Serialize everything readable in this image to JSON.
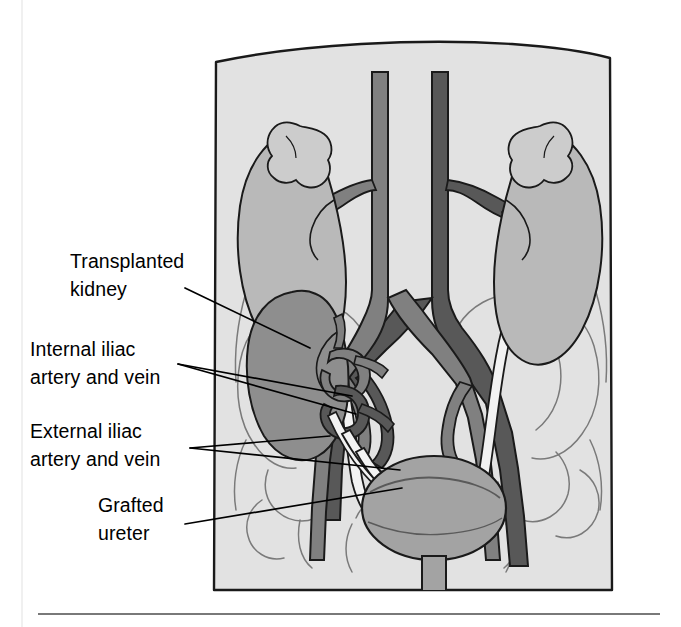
{
  "figure": {
    "title_visible": false,
    "labels": [
      {
        "id": "transplanted-kidney",
        "lines": [
          "Transplanted",
          "kidney"
        ],
        "x": 70,
        "y": 268,
        "align": "start"
      },
      {
        "id": "internal-iliac",
        "lines": [
          "Internal iliac",
          "artery and vein"
        ],
        "x": 30,
        "y": 356,
        "align": "start"
      },
      {
        "id": "external-iliac",
        "lines": [
          "External iliac",
          "artery and vein"
        ],
        "x": 30,
        "y": 438,
        "align": "start"
      },
      {
        "id": "grafted-ureter",
        "lines": [
          "Grafted",
          "ureter"
        ],
        "x": 98,
        "y": 512,
        "align": "start"
      }
    ],
    "colors": {
      "background": "#ffffff",
      "body_fill": "#e2e2e2",
      "body_outline": "#1a1a1a",
      "native_kidney_fill": "#b9b9b9",
      "transplant_kidney_fill": "#8e8e8e",
      "adrenal_fill": "#cccccc",
      "aorta_fill": "#808080",
      "vena_cava_fill": "#585858",
      "bladder_fill": "#a3a3a3",
      "ureter_fill": "#f2f2f2",
      "bone_outline": "#6f6f6f",
      "leader_line": "#000000",
      "rule_line": "#4d4d4d",
      "label_text": "#000000"
    },
    "rule": {
      "x1": 38,
      "x2": 660,
      "y": 614
    },
    "frame_edge": {
      "x": 22,
      "y1": 0,
      "y2": 627
    }
  }
}
